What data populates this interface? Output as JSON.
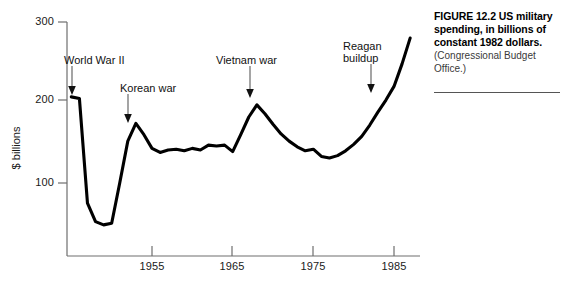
{
  "figure": {
    "caption_title": "FIGURE 12.2  US military spending, in billions of constant 1982 dollars.",
    "caption_source": "(Congressional Budget Office.)"
  },
  "chart_data": {
    "type": "line",
    "title": "US military spending, in billions of constant 1982 dollars",
    "xlabel": "",
    "ylabel": "$ billions",
    "xlim": [
      1945,
      1988
    ],
    "ylim": [
      30,
      300
    ],
    "grid": false,
    "legend": null,
    "xticks": [
      1955,
      1965,
      1975,
      1985
    ],
    "xtick_labels": [
      "1955",
      "1965",
      "1975",
      "1985"
    ],
    "yticks": [
      100,
      200,
      300
    ],
    "ytick_labels": [
      "100",
      "200",
      "300"
    ],
    "line_color": "#000000",
    "series": [
      {
        "name": "US military spending",
        "x": [
          1945,
          1946,
          1947,
          1948,
          1949,
          1950,
          1951,
          1952,
          1953,
          1954,
          1955,
          1956,
          1957,
          1958,
          1959,
          1960,
          1961,
          1962,
          1963,
          1964,
          1965,
          1966,
          1967,
          1968,
          1969,
          1970,
          1971,
          1972,
          1973,
          1974,
          1975,
          1976,
          1977,
          1978,
          1979,
          1980,
          1981,
          1982,
          1983,
          1984,
          1985,
          1986,
          1987
        ],
        "y": [
          207,
          205,
          75,
          52,
          48,
          50,
          100,
          152,
          174,
          160,
          143,
          138,
          141,
          142,
          140,
          143,
          141,
          147,
          146,
          147,
          139,
          160,
          182,
          197,
          186,
          173,
          161,
          152,
          145,
          140,
          142,
          133,
          131,
          134,
          140,
          148,
          158,
          172,
          188,
          203,
          220,
          248,
          280
        ]
      }
    ],
    "annotations": [
      {
        "label": "World War II",
        "target_x": 1946,
        "target_y": 206
      },
      {
        "label": "Korean war",
        "target_x": 1953,
        "target_y": 174
      },
      {
        "label": "Vietnam war",
        "target_x": 1968,
        "target_y": 197
      },
      {
        "label": "Reagan buildup",
        "target_x": 1982,
        "target_y": 172
      }
    ]
  },
  "annotation_text": {
    "world_war_ii": "World War II",
    "korean_war": "Korean war",
    "vietnam_war": "Vietnam war",
    "reagan_line1": "Reagan",
    "reagan_line2": "buildup"
  }
}
